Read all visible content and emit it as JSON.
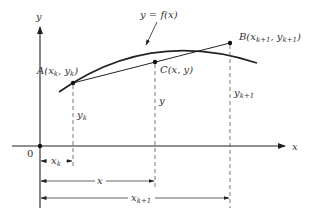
{
  "diagram": {
    "axes": {
      "x_label": "x",
      "y_label": "y",
      "origin_label": "0"
    },
    "curve": {
      "label": "y = f(x)"
    },
    "points": {
      "A": {
        "name": "A",
        "coords": "(x",
        "sub1": "k",
        "sep": ", y",
        "sub2": "k",
        "close": ")"
      },
      "B": {
        "name": "B",
        "coords": "(x",
        "sub1": "k+1",
        "sep": ", y",
        "sub2": "k+1",
        "close": ")"
      },
      "C": {
        "name": "C",
        "coords": "(x, y)"
      }
    },
    "heights": {
      "yk": {
        "base": "y",
        "sub": "k"
      },
      "y": "y",
      "yk1": {
        "base": "y",
        "sub": "k+1"
      }
    },
    "dimensions": {
      "xk": {
        "base": "x",
        "sub": "k"
      },
      "x": "x",
      "xk1": {
        "base": "x",
        "sub": "k+1"
      }
    },
    "colors": {
      "line": "#222222",
      "dashed": "#555555"
    }
  }
}
